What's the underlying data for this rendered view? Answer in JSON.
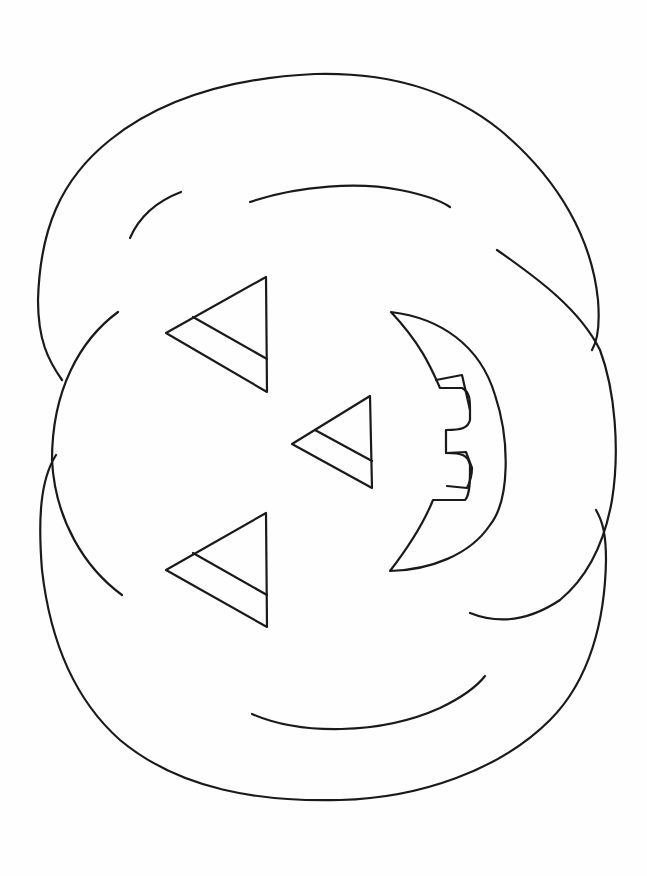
{
  "page": {
    "title": "Jack-o'-lantern coloring page",
    "background": "#fefefe",
    "line_color": "#1a1a1a"
  },
  "drawing": {
    "subject": "pumpkin-jack-o-lantern",
    "orientation": "rotated-90-degrees",
    "parts": [
      {
        "name": "pumpkin-top-lobe"
      },
      {
        "name": "pumpkin-middle-lobe"
      },
      {
        "name": "pumpkin-bottom-lobe"
      },
      {
        "name": "left-eye-triangle"
      },
      {
        "name": "nose-triangle"
      },
      {
        "name": "right-eye-triangle"
      },
      {
        "name": "crescent-mouth-with-teeth"
      },
      {
        "name": "rib-curves"
      }
    ]
  }
}
